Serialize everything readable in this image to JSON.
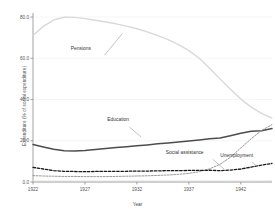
{
  "chart_data": {
    "type": "line",
    "title": "",
    "xlabel": "Year",
    "ylabel": "Expenditure (% of social expenditure)",
    "xlim": [
      1922,
      1945
    ],
    "ylim": [
      0.0,
      80.0
    ],
    "grid": true,
    "legend_position": "inline-annotations",
    "xticks": [
      "1922",
      "1927",
      "1932",
      "1937",
      "1942"
    ],
    "xtick_values": [
      1922,
      1927,
      1932,
      1937,
      1942
    ],
    "yticks": [
      "0.0",
      "20.0",
      "40.0",
      "60.0",
      "80.0"
    ],
    "ytick_values": [
      0.0,
      20.0,
      40.0,
      60.0,
      80.0
    ],
    "x": [
      1922,
      1923,
      1924,
      1925,
      1926,
      1927,
      1928,
      1929,
      1930,
      1931,
      1932,
      1933,
      1934,
      1935,
      1936,
      1937,
      1938,
      1939,
      1940,
      1941,
      1942,
      1943,
      1944,
      1945
    ],
    "series": [
      {
        "name": "Pensions",
        "style": "solid",
        "color": "#d9d9d9",
        "width": 1.4,
        "values": [
          71.0,
          75.5,
          78.6,
          79.9,
          79.8,
          79.2,
          78.4,
          77.6,
          76.7,
          75.6,
          74.3,
          72.8,
          71.0,
          69.0,
          66.6,
          63.7,
          60.0,
          55.2,
          50.0,
          45.0,
          40.2,
          36.3,
          33.3,
          31.0
        ]
      },
      {
        "name": "Education",
        "style": "solid",
        "color": "#4d4d4d",
        "width": 1.5,
        "values": [
          18.2,
          17.0,
          15.9,
          15.2,
          15.0,
          15.3,
          15.8,
          16.2,
          16.7,
          17.1,
          17.6,
          18.0,
          18.5,
          18.9,
          19.4,
          19.9,
          20.4,
          21.0,
          21.3,
          22.4,
          23.6,
          24.6,
          24.9,
          25.9
        ]
      },
      {
        "name": "Social assistance",
        "style": "dashed",
        "color": "#9a9a9a",
        "width": 1.0,
        "values": [
          3.1,
          2.9,
          2.8,
          2.7,
          2.7,
          2.6,
          2.6,
          2.6,
          2.7,
          2.8,
          2.9,
          3.0,
          3.2,
          3.4,
          3.7,
          4.2,
          5.0,
          6.4,
          8.6,
          12.0,
          16.5,
          21.0,
          25.0,
          27.8
        ]
      },
      {
        "name": "Unemployment",
        "style": "dashed",
        "color": "#1a1a1a",
        "width": 1.3,
        "values": [
          7.1,
          6.3,
          5.5,
          5.2,
          5.1,
          5.0,
          5.1,
          5.2,
          5.2,
          5.2,
          5.3,
          5.3,
          5.4,
          5.5,
          5.5,
          5.6,
          5.6,
          5.7,
          5.5,
          5.8,
          6.3,
          7.2,
          8.2,
          9.0
        ]
      },
      {
        "name": "Other",
        "style": "dotted",
        "color": "#e2e2e2",
        "width": 0.9,
        "values": [
          0.6,
          0.6,
          0.6,
          0.6,
          0.6,
          0.6,
          0.6,
          0.6,
          0.6,
          0.6,
          0.6,
          0.6,
          0.6,
          0.6,
          0.6,
          0.6,
          0.6,
          0.6,
          0.6,
          0.6,
          0.6,
          0.6,
          0.6,
          0.7
        ]
      }
    ],
    "annotations": [
      {
        "text": "Pensions",
        "x": 1926.6,
        "y": 64.0
      },
      {
        "text": "Education",
        "x": 1930.2,
        "y": 29.5
      },
      {
        "text": "Social assistance",
        "x": 1936.6,
        "y": 13.5
      },
      {
        "text": "Unemployment",
        "x": 1941.6,
        "y": 12.0
      }
    ]
  },
  "colors": {
    "background": "#ffffff",
    "axis": "#8a8a8a",
    "grid": "#f2f2f2",
    "text": "#4a4a4a"
  }
}
